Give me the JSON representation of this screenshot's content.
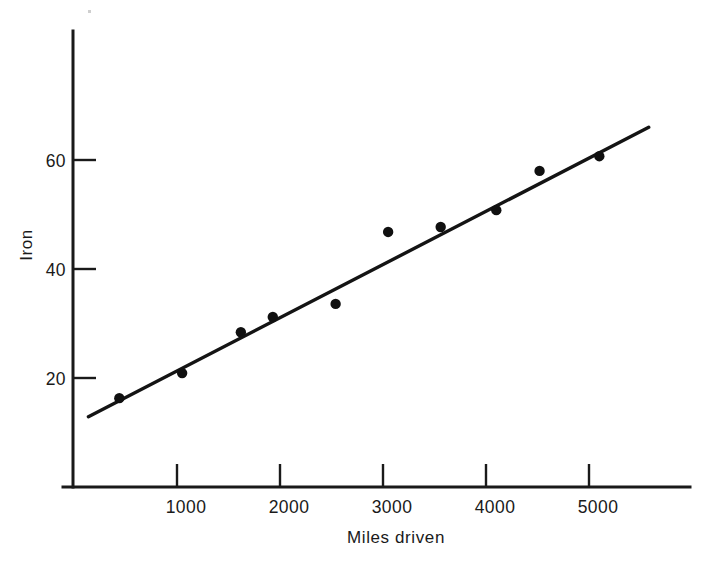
{
  "chart_data": {
    "type": "scatter",
    "title": "",
    "xlabel": "Miles driven",
    "ylabel": "Iron",
    "xlim": [
      0,
      5600
    ],
    "ylim": [
      0,
      78
    ],
    "grid": false,
    "legend": "none",
    "x_ticks": [
      1000,
      2000,
      3000,
      4000,
      5000
    ],
    "x_tick_labels": [
      "1000",
      "2000",
      "3000",
      "4000",
      "5000"
    ],
    "y_ticks": [
      20,
      40,
      60
    ],
    "y_tick_labels": [
      "20",
      "40",
      "60"
    ],
    "tick_direction": "inward",
    "points": [
      {
        "x": 440,
        "y": 16.3
      },
      {
        "x": 1050,
        "y": 20.9
      },
      {
        "x": 1620,
        "y": 28.4
      },
      {
        "x": 1930,
        "y": 31.2
      },
      {
        "x": 2540,
        "y": 33.6
      },
      {
        "x": 3050,
        "y": 46.8
      },
      {
        "x": 3560,
        "y": 47.7
      },
      {
        "x": 4100,
        "y": 50.8
      },
      {
        "x": 4520,
        "y": 58.0
      },
      {
        "x": 5100,
        "y": 60.7
      }
    ],
    "series": [
      {
        "name": "Iron vs Miles driven",
        "x": [
          440,
          1050,
          1620,
          1930,
          2540,
          3050,
          3560,
          4100,
          4520,
          5100
        ],
        "values": [
          16.3,
          20.9,
          28.4,
          31.2,
          33.6,
          46.8,
          47.7,
          50.8,
          58.0,
          60.7
        ]
      }
    ],
    "fit_line": {
      "type": "linear",
      "x_start": 140,
      "y_start": 12.9,
      "x_end": 5580,
      "y_end": 66.0,
      "slope_per_1000_miles": 9.76,
      "intercept": 11.6
    },
    "colors": {
      "axis": "#1a1a1a",
      "point": "#101010",
      "line": "#141414",
      "background": "#ffffff"
    }
  },
  "axes": {
    "y_axis_name": "iron-axis",
    "x_axis_name": "miles-axis"
  }
}
